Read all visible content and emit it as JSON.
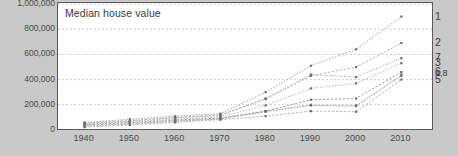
{
  "chart_data": {
    "type": "line",
    "title": "Median house value",
    "xlabel": "",
    "ylabel": "",
    "x": [
      1940,
      1950,
      1960,
      1970,
      1980,
      1990,
      2000,
      2010
    ],
    "xtick_labels": [
      "1940",
      "1950",
      "1960",
      "1970",
      "1980",
      "1990",
      "2000",
      "2010"
    ],
    "ytick_labels": [
      "1,000,000",
      "800,000",
      "600,000",
      "400,000",
      "200,000",
      "0"
    ],
    "ytick_values": [
      1000000,
      800000,
      600000,
      400000,
      200000,
      0
    ],
    "ylim": [
      0,
      1000000
    ],
    "xlim": [
      1935,
      2015
    ],
    "grid": true,
    "grid_axis": "y",
    "legend_position": "right-end-labels",
    "series": [
      {
        "name": "1",
        "label": "1",
        "values": [
          60000,
          85000,
          110000,
          130000,
          300000,
          510000,
          640000,
          900000
        ]
      },
      {
        "name": "2",
        "label": "2",
        "values": [
          55000,
          75000,
          100000,
          120000,
          245000,
          430000,
          500000,
          690000
        ]
      },
      {
        "name": "7",
        "label": "7",
        "values": [
          50000,
          70000,
          95000,
          115000,
          250000,
          440000,
          420000,
          570000
        ]
      },
      {
        "name": "3",
        "label": "3",
        "values": [
          45000,
          65000,
          85000,
          105000,
          195000,
          330000,
          370000,
          530000
        ]
      },
      {
        "name": "6",
        "label": "6",
        "values": [
          40000,
          58000,
          78000,
          95000,
          150000,
          240000,
          250000,
          460000
        ]
      },
      {
        "name": "4",
        "label": "4",
        "values": [
          35000,
          52000,
          72000,
          90000,
          150000,
          200000,
          195000,
          440000
        ]
      },
      {
        "name": "8",
        "label": "8",
        "values": [
          30000,
          48000,
          68000,
          88000,
          145000,
          195000,
          190000,
          430000
        ]
      },
      {
        "name": "5",
        "label": "5",
        "values": [
          22000,
          40000,
          60000,
          82000,
          110000,
          150000,
          145000,
          400000
        ]
      }
    ],
    "end_label_groups": [
      {
        "text": "1",
        "value": 900000
      },
      {
        "text": "2",
        "value": 690000
      },
      {
        "text": "7",
        "value": 570000
      },
      {
        "text": "3",
        "value": 530000
      },
      {
        "text": "6",
        "value": 460000
      },
      {
        "text": "4,8",
        "value": 440000
      },
      {
        "text": "5",
        "value": 400000
      }
    ]
  }
}
